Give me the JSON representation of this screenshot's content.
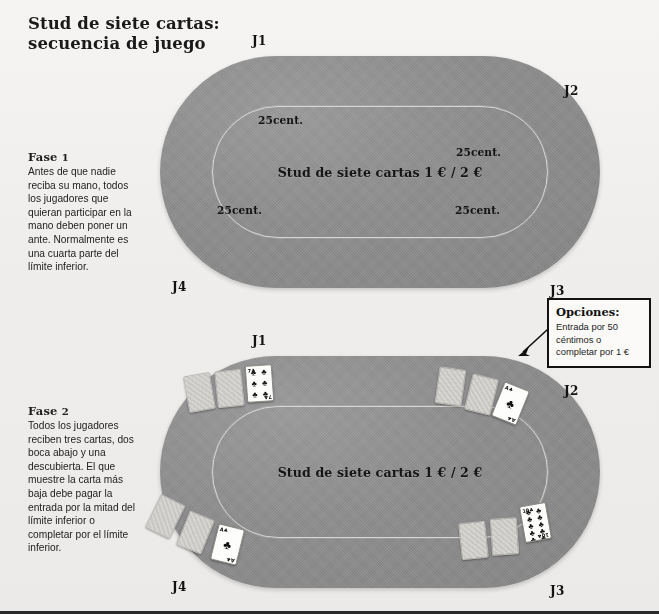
{
  "title": {
    "line1": "Stud de siete cartas:",
    "line2": "secuencia de juego"
  },
  "phases": [
    {
      "heading": "Fase",
      "number": "1",
      "body": "Antes de que nadie reciba su mano, todos los jugadores que quieran participar en la mano deben poner un ante. Normalmente es una cuarta parte del límite inferior."
    },
    {
      "heading": "Fase",
      "number": "2",
      "body": "Todos los jugadores reciben tres cartas, dos boca abajo y una descubierta. El que muestre la carta más baja debe pagar la entrada por la mitad del límite inferior o completar por el límite inferior."
    }
  ],
  "tables": [
    {
      "name": "phase-1-table",
      "center_label": "Stud de siete cartas 1 € / 2 €",
      "antes": [
        "25cent.",
        "25cent.",
        "25cent.",
        "25cent."
      ],
      "players": [
        "J1",
        "J2",
        "J3",
        "J4"
      ]
    },
    {
      "name": "phase-2-table",
      "center_label": "Stud de siete cartas 1 € / 2 €",
      "antes": [],
      "players": [
        "J1",
        "J2",
        "J3",
        "J4"
      ],
      "hands": [
        {
          "player": "J1",
          "cards": [
            "face-down",
            "face-down",
            "seven-of-clubs"
          ]
        },
        {
          "player": "J2",
          "cards": [
            "face-down",
            "face-down",
            "ace-of-clubs"
          ]
        },
        {
          "player": "J4",
          "cards": [
            "face-down",
            "face-down",
            "ace-of-clubs"
          ]
        },
        {
          "player": "J3",
          "cards": [
            "face-down",
            "face-down",
            "ten-of-clubs"
          ]
        }
      ]
    }
  ],
  "callout": {
    "title": "Opciones:",
    "body": "Entrada por 50 céntimos o completar por 1 €"
  },
  "colors": {
    "felt": "#8d8d8d",
    "bet_line": "#d8d6d2",
    "paper": "#f2f1ef",
    "ink": "#121212",
    "card_back": "#cfcdc9"
  },
  "icons": {
    "club": "♣",
    "arrow": "arrow-icon"
  }
}
